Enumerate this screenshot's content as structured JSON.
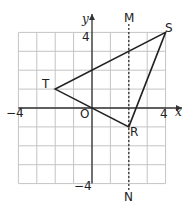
{
  "diagram": {
    "type": "coordinate-grid",
    "x_axis_label": "x",
    "y_axis_label": "y",
    "origin_label": "O",
    "tick_labels": {
      "x_neg": "−4",
      "x_pos": "4",
      "y_pos": "4",
      "y_neg": "−4"
    },
    "grid": {
      "xmin": -4,
      "xmax": 4,
      "ymin": -4,
      "ymax": 4
    },
    "points": [
      {
        "label": "R",
        "x": 2,
        "y": -1
      },
      {
        "label": "S",
        "x": 4,
        "y": 4
      },
      {
        "label": "T",
        "x": -2,
        "y": 1
      }
    ],
    "mirror_line": {
      "top_label": "M",
      "bottom_label": "N",
      "x": 2,
      "style": "dashed"
    },
    "colors": {
      "grid": "#bdbdbd",
      "axes": "#333333",
      "shape": "#222222"
    }
  }
}
